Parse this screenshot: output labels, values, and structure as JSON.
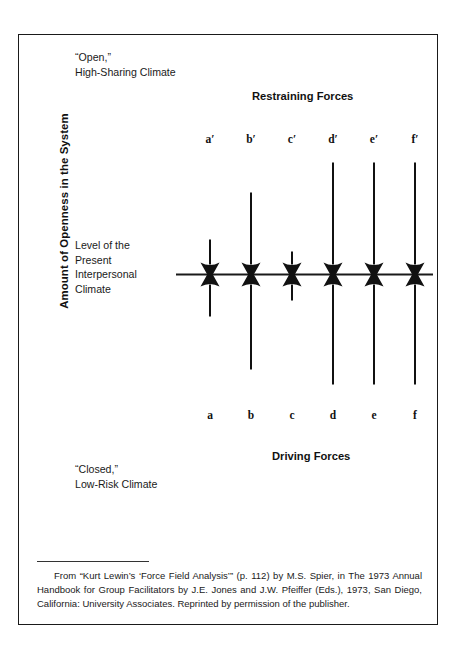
{
  "figure": {
    "y_axis_label": "Amount of Openness in the System",
    "top_note": "“Open,”\nHigh-Sharing Climate",
    "middle_note": "Level of the\nPresent\nInterpersonal\nClimate",
    "bottom_note": "“Closed,”\nLow-Risk Climate",
    "restraining_heading": "Restraining Forces",
    "driving_heading": "Driving Forces",
    "footnote": "From “Kurt Lewin’s ‘Force Field Analysis’” (p. 112) by M.S. Spier, in The 1973 Annual Handbook for Group Facilitators by J.E. Jones and J.W. Pfeiffer (Eds.), 1973, San Diego, California: University Associates. Reprinted by permission of the publisher.",
    "colors": {
      "ink": "#111111",
      "frame": "#1a1a1a",
      "background": "#ffffff"
    }
  },
  "chart_data": {
    "type": "bar",
    "title": "Force Field Analysis",
    "xlabel": "",
    "ylabel": "Amount of Openness in the System",
    "grid": false,
    "legend": "none",
    "baseline_label": "Level of the Present Interpersonal Climate",
    "axis_notes": {
      "top": "“Open,” High-Sharing Climate",
      "bottom": "“Closed,” Low-Risk Climate"
    },
    "series": [
      {
        "name": "Restraining Forces",
        "direction": "down",
        "categories": [
          "a′",
          "b′",
          "c′",
          "d′",
          "e′",
          "f′"
        ],
        "values": [
          40,
          87,
          28,
          117,
          117,
          117
        ]
      },
      {
        "name": "Driving Forces",
        "direction": "up",
        "categories": [
          "a",
          "b",
          "c",
          "d",
          "e",
          "f"
        ],
        "values": [
          47,
          100,
          31,
          115,
          115,
          115
        ]
      }
    ],
    "ylim": [
      -130,
      130
    ]
  }
}
